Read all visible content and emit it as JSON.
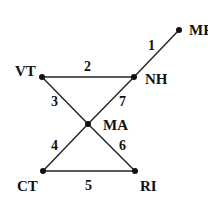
{
  "diagram": {
    "type": "graph",
    "nodes": [
      {
        "id": "ME",
        "label": "ME",
        "x": 179,
        "y": 30,
        "lx": 189,
        "ly": 35
      },
      {
        "id": "NH",
        "label": "NH",
        "x": 134,
        "y": 77,
        "lx": 145,
        "ly": 84
      },
      {
        "id": "VT",
        "label": "VT",
        "x": 42,
        "y": 77,
        "lx": 15,
        "ly": 76
      },
      {
        "id": "MA",
        "label": "MA",
        "x": 88,
        "y": 124,
        "lx": 103,
        "ly": 130
      },
      {
        "id": "CT",
        "label": "CT",
        "x": 43,
        "y": 171,
        "lx": 17,
        "ly": 191
      },
      {
        "id": "RI",
        "label": "RI",
        "x": 135,
        "y": 171,
        "lx": 140,
        "ly": 191
      }
    ],
    "edges": [
      {
        "label": "1",
        "from": "NH",
        "to": "ME",
        "lx": 148,
        "ly": 50
      },
      {
        "label": "2",
        "from": "VT",
        "to": "NH",
        "lx": 84,
        "ly": 71
      },
      {
        "label": "3",
        "from": "VT",
        "to": "MA",
        "lx": 51,
        "ly": 106
      },
      {
        "label": "4",
        "from": "MA",
        "to": "CT",
        "lx": 51,
        "ly": 150
      },
      {
        "label": "5",
        "from": "CT",
        "to": "RI",
        "lx": 85,
        "ly": 190
      },
      {
        "label": "6",
        "from": "MA",
        "to": "RI",
        "lx": 119,
        "ly": 150
      },
      {
        "label": "7",
        "from": "MA",
        "to": "NH",
        "lx": 119,
        "ly": 106
      }
    ]
  }
}
